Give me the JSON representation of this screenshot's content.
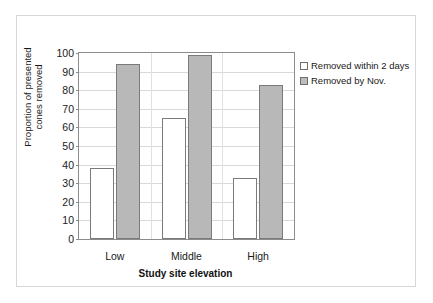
{
  "chart_data": {
    "type": "bar",
    "title": "",
    "xlabel": "Study site elevation",
    "ylabel": "Proportion of presented cones removed",
    "ylabel_lines": [
      "Proportion of presented",
      "cones removed"
    ],
    "categories": [
      "Low",
      "Middle",
      "High"
    ],
    "series": [
      {
        "name": "Removed within 2 days",
        "values": [
          38,
          65,
          33
        ],
        "color": "#ffffff"
      },
      {
        "name": "Removed by Nov.",
        "values": [
          94,
          99,
          83
        ],
        "color": "#b8b8b8"
      }
    ],
    "ylim": [
      0,
      100
    ],
    "yticks": [
      0,
      10,
      20,
      30,
      40,
      50,
      60,
      70,
      80,
      90,
      100
    ],
    "grid": true,
    "legend_position": "right",
    "legend": [
      "Removed within 2 days",
      "Removed by Nov."
    ]
  }
}
